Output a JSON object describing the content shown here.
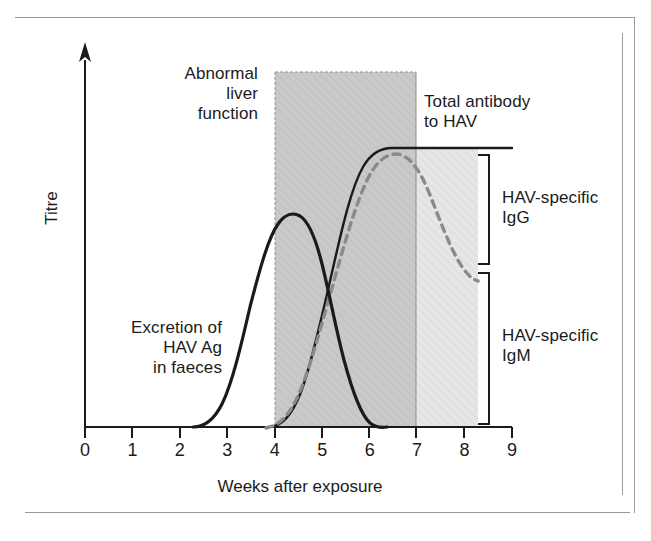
{
  "figure": {
    "y_axis_label": "Titre",
    "x_axis_label": "Weeks after exposure",
    "annotations": {
      "abnormal_liver_function": "Abnormal\nliver\nfunction",
      "total_antibody": "Total antibody\nto HAV",
      "hav_specific_igg": "HAV-specific\nIgG",
      "hav_specific_igm": "HAV-specific\nIgM",
      "excretion": "Excretion of\nHAV Ag\nin faeces"
    },
    "colors": {
      "ink": "#1b1b1b",
      "curve_solid": "#1a1a1a",
      "curve_dashed": "#8a8a8a",
      "band_abnormal_liver": "#c9c9c9",
      "band_antibody": "#e4e4e4",
      "frame_rule": "#9a9a9a",
      "bracket": "#1a1a1a"
    }
  },
  "chart_data": {
    "type": "line",
    "title": "",
    "xlabel": "Weeks after exposure",
    "ylabel": "Titre",
    "xlim": [
      0,
      9
    ],
    "ylim": [
      0,
      1
    ],
    "grid": false,
    "legend_position": "inline-annotations",
    "xticks": [
      0,
      1,
      2,
      3,
      4,
      5,
      6,
      7,
      8,
      9
    ],
    "xtick_labels": [
      "0",
      "1",
      "2",
      "3",
      "4",
      "5",
      "6",
      "7",
      "8",
      "9"
    ],
    "yticks": [],
    "ytick_labels": [],
    "series": [
      {
        "name": "Excretion of HAV Ag in faeces",
        "style": "solid",
        "color": "#1a1a1a",
        "x": [
          2.3,
          2.6,
          2.9,
          3.2,
          3.5,
          3.8,
          4.1,
          4.4,
          4.7,
          5.0,
          5.3,
          5.6,
          5.9,
          6.2,
          6.45
        ],
        "y": [
          0.0,
          0.04,
          0.12,
          0.27,
          0.42,
          0.5,
          0.525,
          0.53,
          0.5,
          0.42,
          0.32,
          0.22,
          0.13,
          0.05,
          0.0
        ]
      },
      {
        "name": "Total antibody to HAV",
        "style": "solid",
        "color": "#1a1a1a",
        "x": [
          3.9,
          4.2,
          4.5,
          4.8,
          5.1,
          5.4,
          5.7,
          6.0,
          6.4,
          7.0,
          8.0,
          9.0
        ],
        "y": [
          0.0,
          0.07,
          0.17,
          0.33,
          0.52,
          0.7,
          0.85,
          0.93,
          0.96,
          0.96,
          0.96,
          0.96
        ]
      },
      {
        "name": "HAV-specific IgG",
        "style": "dashed",
        "color": "#8a8a8a",
        "x": [
          3.85,
          4.2,
          4.6,
          5.0,
          5.4,
          5.8,
          6.1,
          6.4,
          6.7,
          7.0,
          7.3,
          7.6,
          7.9,
          8.2,
          8.4
        ],
        "y": [
          0.0,
          0.06,
          0.16,
          0.3,
          0.48,
          0.68,
          0.8,
          0.88,
          0.9,
          0.88,
          0.81,
          0.7,
          0.56,
          0.43,
          0.37
        ]
      }
    ],
    "shaded_regions": [
      {
        "name": "Abnormal liver function",
        "type": "vertical-band",
        "x_start": 4.0,
        "x_end": 7.0,
        "y_top": 1.13,
        "fill": "#c9c9c9"
      },
      {
        "name": "Total antibody fill",
        "type": "area-under-curve",
        "series": "Total antibody to HAV",
        "x_start": 3.9,
        "x_end": 8.4,
        "fill": "#e4e4e4"
      }
    ],
    "brackets": [
      {
        "name": "HAV-specific IgG",
        "x": 8.55,
        "y_top": 0.96,
        "y_bottom": 0.37
      },
      {
        "name": "HAV-specific IgM",
        "x": 8.55,
        "y_top": 0.355,
        "y_bottom": 0.0
      }
    ],
    "reference_lines": [
      {
        "name": "Total antibody plateau",
        "orientation": "horizontal",
        "y": 0.96,
        "x_start": 6.4,
        "x_end": 9.05
      }
    ]
  }
}
